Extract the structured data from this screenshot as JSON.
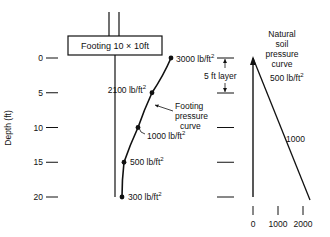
{
  "footing": {
    "label": "Footing 10 × 10ft"
  },
  "depth_axis": {
    "title": "Depth (ft)",
    "ticks": [
      "0",
      "5",
      "10",
      "15",
      "20"
    ],
    "values": [
      0,
      5,
      10,
      15,
      20
    ]
  },
  "footing_curve": {
    "label_lines": [
      "Footing",
      "pressure",
      "curve"
    ],
    "points": [
      {
        "depth": 0,
        "pressure": 3000,
        "label": "3000 lb/ft",
        "sup": "2"
      },
      {
        "depth": 5,
        "pressure": 2100,
        "label": "2100 lb/ft",
        "sup": "2"
      },
      {
        "depth": 10,
        "pressure": 1000,
        "label": "1000 lb/ft",
        "sup": "2"
      },
      {
        "depth": 15,
        "pressure": 500,
        "label": "500 lb/ft",
        "sup": "2"
      },
      {
        "depth": 20,
        "pressure": 300,
        "label": "300 lb/ft",
        "sup": "2"
      }
    ]
  },
  "layer": {
    "label": "5 ft layer",
    "top_depth": 0,
    "bottom_depth": 5
  },
  "natural_curve": {
    "label_lines": [
      "Natural",
      "soil",
      "pressure",
      "curve"
    ],
    "annotations": [
      {
        "depth": 2.8,
        "label": "500 lb/ft",
        "sup": "2"
      },
      {
        "depth": 10,
        "label": "1000"
      }
    ],
    "x_ticks": [
      "0",
      "1000",
      "2000"
    ],
    "x_values": [
      0,
      1000,
      2000
    ],
    "surface_pressure": 0,
    "pressure_at_20ft": 2200
  }
}
